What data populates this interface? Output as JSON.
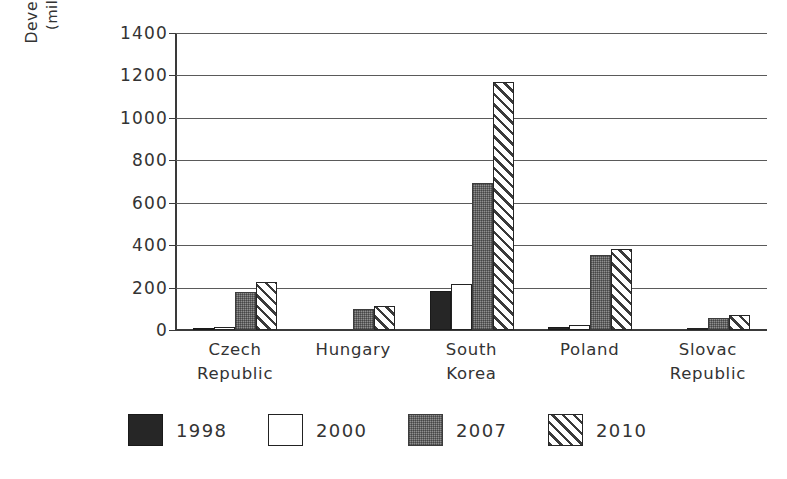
{
  "chart_data": {
    "type": "bar",
    "title": "",
    "xlabel": "",
    "ylabel": "Development Assistance (millions of US dollars)",
    "ylabel_line1": "Development Assistance",
    "ylabel_line2": "(millions of US dollars)",
    "ylim": [
      0,
      1400
    ],
    "ytick_step": 200,
    "yticks": [
      0,
      200,
      400,
      600,
      800,
      1000,
      1200,
      1400
    ],
    "ytick_labels": [
      "0",
      "200",
      "400",
      "600",
      "800",
      "1000",
      "1200",
      "1400"
    ],
    "grid": "horizontal",
    "legend_position": "bottom",
    "categories": [
      "Czech\nRepublic",
      "Hungary",
      "South\nKorea",
      "Poland",
      "Slovac\nRepublic"
    ],
    "category_labels": [
      "Czech Republic",
      "Hungary",
      "South Korea",
      "Poland",
      "Slovac Republic"
    ],
    "series": [
      {
        "name": "1998",
        "fill": "solid-black",
        "color": "#262626",
        "values": [
          10,
          0,
          185,
          12,
          0
        ]
      },
      {
        "name": "2000",
        "fill": "white-outline",
        "color": "#ffffff",
        "values": [
          15,
          0,
          215,
          25,
          4
        ]
      },
      {
        "name": "2007",
        "fill": "gray-dither",
        "color": "#8f8f8f",
        "values": [
          180,
          100,
          695,
          355,
          55
        ]
      },
      {
        "name": "2010",
        "fill": "diagonal-hatch",
        "color": "#ffffff",
        "values": [
          225,
          115,
          1170,
          380,
          70
        ]
      }
    ]
  },
  "legend": {
    "items": [
      {
        "label": "1998",
        "fill": "solid-black"
      },
      {
        "label": "2000",
        "fill": "white-outline"
      },
      {
        "label": "2007",
        "fill": "gray-dither"
      },
      {
        "label": "2010",
        "fill": "diagonal-hatch"
      }
    ]
  },
  "colors": {
    "background": "#ffffff",
    "axis": "#3a3a3a",
    "grid": "#5a5a5a",
    "text": "#333333",
    "series_1998": "#262626",
    "series_2000": "#ffffff",
    "series_2007": "#8f8f8f",
    "series_2010": "#ffffff"
  }
}
